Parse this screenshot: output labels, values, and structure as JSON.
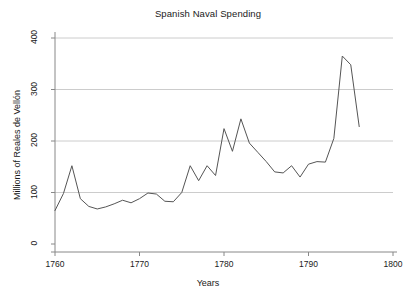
{
  "chart_data": {
    "type": "line",
    "title": "Spanish Naval Spending",
    "xlabel": "Years",
    "ylabel": "Millions of Reales de Vellón",
    "xlim": [
      1760,
      1800
    ],
    "ylim": [
      0,
      400
    ],
    "xticks": [
      1760,
      1770,
      1780,
      1790,
      1800
    ],
    "yticks": [
      0,
      100,
      200,
      300,
      400
    ],
    "grid": "horizontal",
    "legend": null,
    "line_color": "#555555",
    "grid_color": "#cccccc",
    "axis_color": "#888888",
    "series": [
      {
        "name": "Spanish Naval Spending",
        "x": [
          1760,
          1761,
          1762,
          1763,
          1764,
          1765,
          1766,
          1767,
          1768,
          1769,
          1770,
          1771,
          1772,
          1773,
          1774,
          1775,
          1776,
          1777,
          1778,
          1779,
          1780,
          1781,
          1782,
          1783,
          1784,
          1785,
          1786,
          1787,
          1788,
          1789,
          1790,
          1791,
          1792,
          1793,
          1794,
          1795,
          1796
        ],
        "values": [
          65,
          98,
          152,
          88,
          73,
          68,
          72,
          78,
          85,
          80,
          88,
          99,
          97,
          83,
          82,
          100,
          152,
          123,
          152,
          133,
          224,
          180,
          243,
          196,
          178,
          160,
          140,
          138,
          152,
          130,
          155,
          160,
          159,
          205,
          365,
          348,
          228
        ]
      }
    ]
  }
}
